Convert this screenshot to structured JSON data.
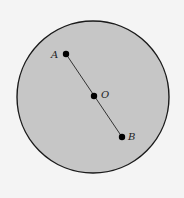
{
  "diagram": {
    "circle": {
      "cx": 93,
      "cy": 97,
      "r": 76,
      "fill": "#c6c6c6",
      "stroke": "#1a1a1a"
    },
    "points": [
      {
        "id": "A",
        "label": "A",
        "x": 66,
        "y": 54,
        "lx": 51,
        "ly": 58
      },
      {
        "id": "O",
        "label": "O",
        "x": 94,
        "y": 96,
        "lx": 101,
        "ly": 98
      },
      {
        "id": "B",
        "label": "B",
        "x": 122,
        "y": 137,
        "lx": 128,
        "ly": 140
      }
    ],
    "segment": {
      "from": "A",
      "to": "B"
    }
  }
}
